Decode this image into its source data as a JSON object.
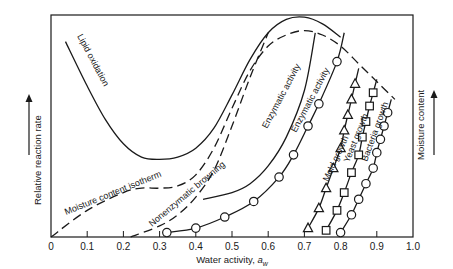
{
  "chart_data": {
    "type": "line",
    "title": "",
    "xlabel": "Water activity, a_w",
    "ylabel_left": "Relative reaction rate",
    "ylabel_right": "Moisture content",
    "xlim": [
      0,
      1.0
    ],
    "ylim": [
      0,
      1.0
    ],
    "x_ticks": [
      "0",
      "0.1",
      "0.2",
      "0.3",
      "0.4",
      "0.5",
      "0.6",
      "0.7",
      "0.8",
      "0.9",
      "1.0"
    ],
    "grid": false,
    "legend": "none (curves labeled inline)",
    "series": [
      {
        "name": "Lipid oxidation",
        "style": "solid",
        "x": [
          0.04,
          0.1,
          0.15,
          0.2,
          0.25,
          0.3,
          0.35,
          0.4,
          0.45,
          0.5,
          0.55,
          0.6,
          0.65,
          0.7,
          0.75,
          0.8
        ],
        "y": [
          0.88,
          0.68,
          0.53,
          0.42,
          0.36,
          0.35,
          0.36,
          0.4,
          0.49,
          0.64,
          0.8,
          0.92,
          0.98,
          0.99,
          0.96,
          0.9
        ]
      },
      {
        "name": "Moisture content isotherm",
        "style": "dashed",
        "x": [
          0.0,
          0.1,
          0.2,
          0.25,
          0.3,
          0.35,
          0.4,
          0.45,
          0.5,
          0.55,
          0.6,
          0.65,
          0.7,
          0.75,
          0.8,
          0.85,
          0.9,
          0.95
        ],
        "y": [
          0.0,
          0.12,
          0.2,
          0.22,
          0.22,
          0.23,
          0.28,
          0.4,
          0.58,
          0.75,
          0.86,
          0.91,
          0.93,
          0.91,
          0.86,
          0.78,
          0.7,
          0.62
        ]
      },
      {
        "name": "Nonenzymatic browning",
        "style": "dashed",
        "x": [
          0.22,
          0.3,
          0.35,
          0.4,
          0.45,
          0.5,
          0.55,
          0.6
        ],
        "y": [
          0.0,
          0.05,
          0.1,
          0.18,
          0.3,
          0.5,
          0.72,
          0.92
        ]
      },
      {
        "name": "Enzymatic activity",
        "style": "solid",
        "x": [
          0.42,
          0.5,
          0.55,
          0.6,
          0.65,
          0.7,
          0.73
        ],
        "y": [
          0.17,
          0.2,
          0.24,
          0.32,
          0.45,
          0.66,
          0.92
        ]
      },
      {
        "name": "Enzymatic activity",
        "style": "solid with circle markers",
        "x": [
          0.32,
          0.4,
          0.48,
          0.56,
          0.63,
          0.67,
          0.71,
          0.74,
          0.79,
          0.81
        ],
        "y": [
          0.02,
          0.04,
          0.09,
          0.16,
          0.27,
          0.37,
          0.5,
          0.6,
          0.79,
          0.92
        ]
      },
      {
        "name": "Mold growth",
        "style": "solid with triangle markers",
        "x": [
          0.71,
          0.74,
          0.76,
          0.78,
          0.8,
          0.81,
          0.82,
          0.83,
          0.84,
          0.85
        ],
        "y": [
          0.04,
          0.13,
          0.22,
          0.31,
          0.4,
          0.48,
          0.55,
          0.62,
          0.69,
          0.76
        ]
      },
      {
        "name": "Yeast growth",
        "style": "solid with square markers",
        "x": [
          0.76,
          0.79,
          0.81,
          0.83,
          0.85,
          0.86,
          0.87,
          0.88,
          0.89,
          0.9
        ],
        "y": [
          0.03,
          0.12,
          0.2,
          0.29,
          0.37,
          0.45,
          0.52,
          0.59,
          0.65,
          0.71
        ]
      },
      {
        "name": "Bacteria growth",
        "style": "solid with circle markers",
        "x": [
          0.8,
          0.83,
          0.85,
          0.87,
          0.89,
          0.9,
          0.91,
          0.92,
          0.93,
          0.94
        ],
        "y": [
          0.02,
          0.1,
          0.17,
          0.24,
          0.31,
          0.38,
          0.44,
          0.5,
          0.56,
          0.62
        ]
      }
    ],
    "annotations": [
      "Lipid oxidation",
      "Moisture content isotherm",
      "Nonenzymatic browning",
      "Enzymatic activity",
      "Enzymatic activity",
      "Mold growth",
      "Yeast growth",
      "Bacteria growth"
    ]
  },
  "labels": {
    "xlabel": "Water activity, ",
    "xlabel_symbol": "a",
    "xlabel_sub": "w",
    "ylabel_left": "Relative reaction rate",
    "ylabel_right": "Moisture content",
    "lipid": "Lipid oxidation",
    "isotherm": "Moisture content isotherm",
    "browning": "Nonenzymatic browning",
    "enzymatic1": "Enzymatic activity",
    "enzymatic2": "Enzymatic activity",
    "mold": "Mold growth",
    "yeast": "Yeast growth",
    "bacteria": "Bacteria growth"
  }
}
